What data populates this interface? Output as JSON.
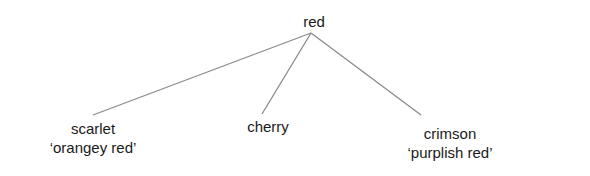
{
  "diagram": {
    "type": "tree",
    "line_color": "#8a8a8a",
    "text_color": "#1a1a1a",
    "root": {
      "label": "red"
    },
    "children": [
      {
        "label": "scarlet",
        "gloss": "‘orangey red’"
      },
      {
        "label": "cherry",
        "gloss": ""
      },
      {
        "label": "crimson",
        "gloss": "‘purplish red’"
      }
    ],
    "edges": [
      {
        "from": "red",
        "to": "scarlet"
      },
      {
        "from": "red",
        "to": "cherry"
      },
      {
        "from": "red",
        "to": "crimson"
      }
    ]
  }
}
